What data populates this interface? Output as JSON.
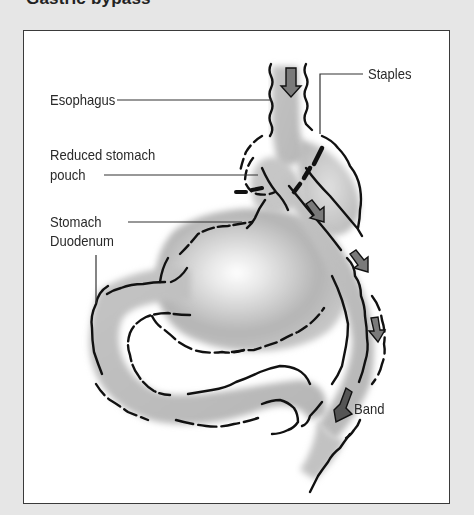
{
  "figure": {
    "title": "Gastric bypass",
    "labels": {
      "esophagus": "Esophagus",
      "staples": "Staples",
      "reduced_pouch_line1": "Reduced stomach",
      "reduced_pouch_line2": "pouch",
      "stomach": "Stomach",
      "duodenum": "Duodenum",
      "band": "Band"
    }
  },
  "colors": {
    "page_background": "#e6e6e6",
    "frame_background": "#ffffff",
    "frame_border": "#3a3a3a",
    "organ_fill": "#bdbdbd",
    "outline": "#111111",
    "arrow_fill": "#7a7a7a"
  }
}
